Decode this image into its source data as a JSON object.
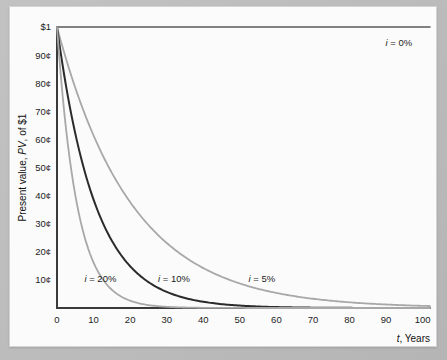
{
  "chart_data": {
    "type": "line",
    "title": "",
    "subtitle": "",
    "xlabel": "t, Years",
    "xlabel_italic_part": "t",
    "xlabel_rest": ", Years",
    "ylabel": "Present value, PV, of $1",
    "ylabel_prefix": "Present value, ",
    "ylabel_italic_part": "PV",
    "ylabel_suffix": ", of $1",
    "xlim": [
      0,
      102
    ],
    "ylim": [
      0,
      1
    ],
    "grid": false,
    "legend_position": "inline-annotations",
    "x_ticks": [
      0,
      10,
      20,
      30,
      40,
      50,
      60,
      70,
      80,
      90,
      100
    ],
    "x_tick_labels": [
      "0",
      "10",
      "20",
      "30",
      "40",
      "50",
      "60",
      "70",
      "80",
      "90",
      "100"
    ],
    "y_ticks": [
      0.1,
      0.2,
      0.3,
      0.4,
      0.5,
      0.6,
      0.7,
      0.8,
      0.9,
      1.0
    ],
    "y_tick_labels": [
      "10¢",
      "20¢",
      "30¢",
      "40¢",
      "50¢",
      "60¢",
      "70¢",
      "80¢",
      "90¢",
      "$1"
    ],
    "x": [
      0,
      5,
      10,
      15,
      20,
      25,
      30,
      35,
      40,
      45,
      50,
      55,
      60,
      65,
      70,
      75,
      80,
      85,
      90,
      95,
      100
    ],
    "series": [
      {
        "name": "i = 0%",
        "rate": 0.0,
        "color": "#5a5a5a",
        "width": 1.6,
        "annotation": "i = 0%",
        "annotation_italic": "i",
        "annotation_rest": " = 0%",
        "values": [
          1.0,
          1.0,
          1.0,
          1.0,
          1.0,
          1.0,
          1.0,
          1.0,
          1.0,
          1.0,
          1.0,
          1.0,
          1.0,
          1.0,
          1.0,
          1.0,
          1.0,
          1.0,
          1.0,
          1.0,
          1.0
        ]
      },
      {
        "name": "i = 5%",
        "rate": 0.05,
        "color": "#a8a8a8",
        "width": 1.8,
        "annotation": "i = 5%",
        "annotation_italic": "i",
        "annotation_rest": " = 5%",
        "values": [
          1.0,
          0.784,
          0.614,
          0.481,
          0.377,
          0.295,
          0.231,
          0.181,
          0.142,
          0.111,
          0.087,
          0.068,
          0.054,
          0.042,
          0.033,
          0.026,
          0.02,
          0.016,
          0.012,
          0.01,
          0.008
        ]
      },
      {
        "name": "i = 10%",
        "rate": 0.1,
        "color": "#2b2b2b",
        "width": 2.0,
        "annotation": "i = 10%",
        "annotation_italic": "i",
        "annotation_rest": " = 10%",
        "values": [
          1.0,
          0.621,
          0.386,
          0.239,
          0.149,
          0.092,
          0.057,
          0.036,
          0.022,
          0.014,
          0.009,
          0.005,
          0.003,
          0.002,
          0.001,
          0.001,
          0.0,
          0.0,
          0.0,
          0.0,
          0.0
        ]
      },
      {
        "name": "i = 20%",
        "rate": 0.2,
        "color": "#a8a8a8",
        "width": 1.8,
        "annotation": "i = 20%",
        "annotation_italic": "i",
        "annotation_rest": " = 20%",
        "values": [
          1.0,
          0.402,
          0.162,
          0.065,
          0.026,
          0.01,
          0.004,
          0.002,
          0.001,
          0.0,
          0.0,
          0.0,
          0.0,
          0.0,
          0.0,
          0.0,
          0.0,
          0.0,
          0.0,
          0.0,
          0.0
        ]
      }
    ],
    "annotations": [
      {
        "text": "i = 0%",
        "italic": "i",
        "rest": " = 0%",
        "x": 93.5,
        "y": 0.945,
        "anchor": "middle"
      },
      {
        "text": "i = 5%",
        "italic": "i",
        "rest": " = 5%",
        "x": 56.0,
        "y": 0.105,
        "anchor": "middle"
      },
      {
        "text": "i = 10%",
        "italic": "i",
        "rest": " = 10%",
        "x": 32.0,
        "y": 0.105,
        "anchor": "middle"
      },
      {
        "text": "i = 20%",
        "italic": "i",
        "rest": " = 20%",
        "x": 7.5,
        "y": 0.105,
        "anchor": "start"
      }
    ]
  }
}
